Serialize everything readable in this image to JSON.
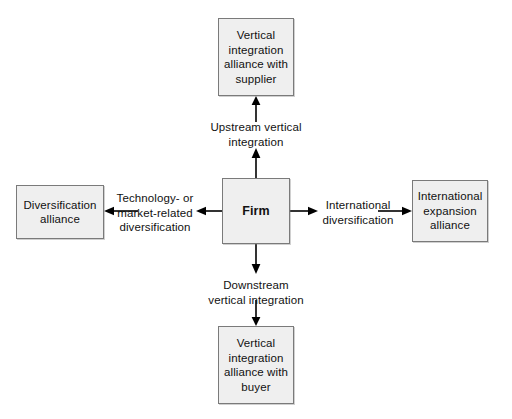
{
  "diagram": {
    "background_color": "#ffffff",
    "node_fill_color": "#efefef",
    "node_border_color": "#7a7a7a",
    "arrow_color": "#000000",
    "center": {
      "id": "firm",
      "label": "Firm"
    },
    "nodes": {
      "top": {
        "id": "vertical-integration-alliance-supplier",
        "label": "Vertical\nintegration\nalliance with\nsupplier"
      },
      "bottom": {
        "id": "vertical-integration-alliance-buyer",
        "label": "Vertical\nintegration\nalliance with\nbuyer"
      },
      "left": {
        "id": "diversification-alliance",
        "label": "Diversification\nalliance"
      },
      "right": {
        "id": "international-expansion-alliance",
        "label": "International\nexpansion\nalliance"
      }
    },
    "edges": {
      "up": {
        "id": "upstream-vertical-integration",
        "label": "Upstream vertical\nintegration",
        "direction": "up"
      },
      "down": {
        "id": "downstream-vertical-integration",
        "label": "Downstream\nvertical integration",
        "direction": "down"
      },
      "left": {
        "id": "technology-or-market-related-diversification",
        "label": "Technology- or\nmarket-related\ndiversification",
        "direction": "left"
      },
      "right": {
        "id": "international-diversification",
        "label": "International\ndiversification",
        "direction": "right"
      }
    }
  }
}
